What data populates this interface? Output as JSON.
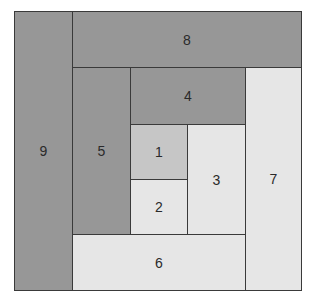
{
  "diagram": {
    "type": "nested-rectangle-spiral",
    "colors": {
      "dark": "#979797",
      "mid": "#c6c6c6",
      "light": "#e6e6e6",
      "border": "#3a3a3a"
    },
    "blocks": [
      {
        "label": "1",
        "shade": "mid",
        "x": 130,
        "y": 124,
        "w": 58,
        "h": 56
      },
      {
        "label": "2",
        "shade": "light",
        "x": 130,
        "y": 179,
        "w": 58,
        "h": 56
      },
      {
        "label": "3",
        "shade": "light",
        "x": 187,
        "y": 124,
        "w": 59,
        "h": 111
      },
      {
        "label": "4",
        "shade": "dark",
        "x": 130,
        "y": 67,
        "w": 116,
        "h": 58
      },
      {
        "label": "5",
        "shade": "dark",
        "x": 72,
        "y": 67,
        "w": 59,
        "h": 168
      },
      {
        "label": "6",
        "shade": "light",
        "x": 72,
        "y": 234,
        "w": 174,
        "h": 57
      },
      {
        "label": "7",
        "shade": "light",
        "x": 245,
        "y": 67,
        "w": 57,
        "h": 224
      },
      {
        "label": "8",
        "shade": "dark",
        "x": 72,
        "y": 11,
        "w": 230,
        "h": 57
      },
      {
        "label": "9",
        "shade": "dark",
        "x": 14,
        "y": 11,
        "w": 59,
        "h": 280
      }
    ]
  }
}
